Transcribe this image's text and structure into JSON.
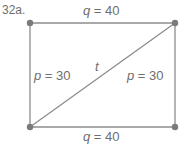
{
  "problem": {
    "number": "32a."
  },
  "diagram": {
    "shape": "rectangle-with-diagonal",
    "colors": {
      "line": "#8c8c8c",
      "vertex": "#7a7a7a",
      "text": "#6e6e6e"
    },
    "vertices": [
      {
        "id": "top-left",
        "x": 30,
        "y": 23
      },
      {
        "id": "top-right",
        "x": 175,
        "y": 23
      },
      {
        "id": "bottom-left",
        "x": 30,
        "y": 127
      },
      {
        "id": "bottom-right",
        "x": 175,
        "y": 127
      }
    ],
    "labels": {
      "top": {
        "var": "q",
        "eq": " = 40"
      },
      "bottom": {
        "var": "q",
        "eq": " = 40"
      },
      "left": {
        "var": "p",
        "eq": " = 30"
      },
      "right": {
        "var": "p",
        "eq": " = 30"
      },
      "diagonal": {
        "var": "t"
      }
    }
  }
}
